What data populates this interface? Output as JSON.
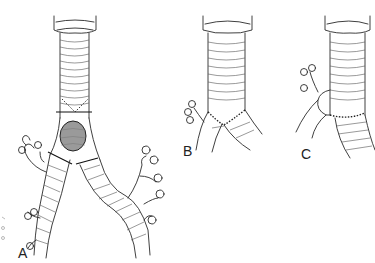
{
  "figure": {
    "panels": [
      {
        "id": "A",
        "label": "A",
        "description": "Trachea and main bronchi with carinal tumor and resection lines"
      },
      {
        "id": "B",
        "label": "B",
        "description": "Reconstruction with end-to-end tracheal anastomosis to main bronchi"
      },
      {
        "id": "C",
        "label": "C",
        "description": "Reconstruction with side-to-end bronchial reimplantation into trachea"
      }
    ],
    "colors": {
      "line": "#2a2a2a",
      "tumor": "#9a9a9a",
      "background": "#ffffff"
    }
  }
}
